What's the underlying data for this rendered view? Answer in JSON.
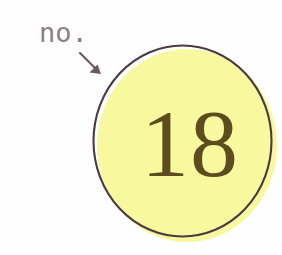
{
  "figure": {
    "type": "annotated-diagram",
    "background_color": "#fefefe",
    "caption": {
      "text": "no.",
      "color": "#8b8184"
    },
    "pointer": {
      "icon": "arrow-down-right-icon",
      "color": "#6b5b5e",
      "from_x": 80,
      "from_y": 53,
      "to_x": 101,
      "to_y": 74
    },
    "badge": {
      "value": "18",
      "value_color": "#5d4d1e",
      "fill_color": "#f8f89e",
      "outline_color": "#4a3a42",
      "shape": "circle"
    }
  }
}
